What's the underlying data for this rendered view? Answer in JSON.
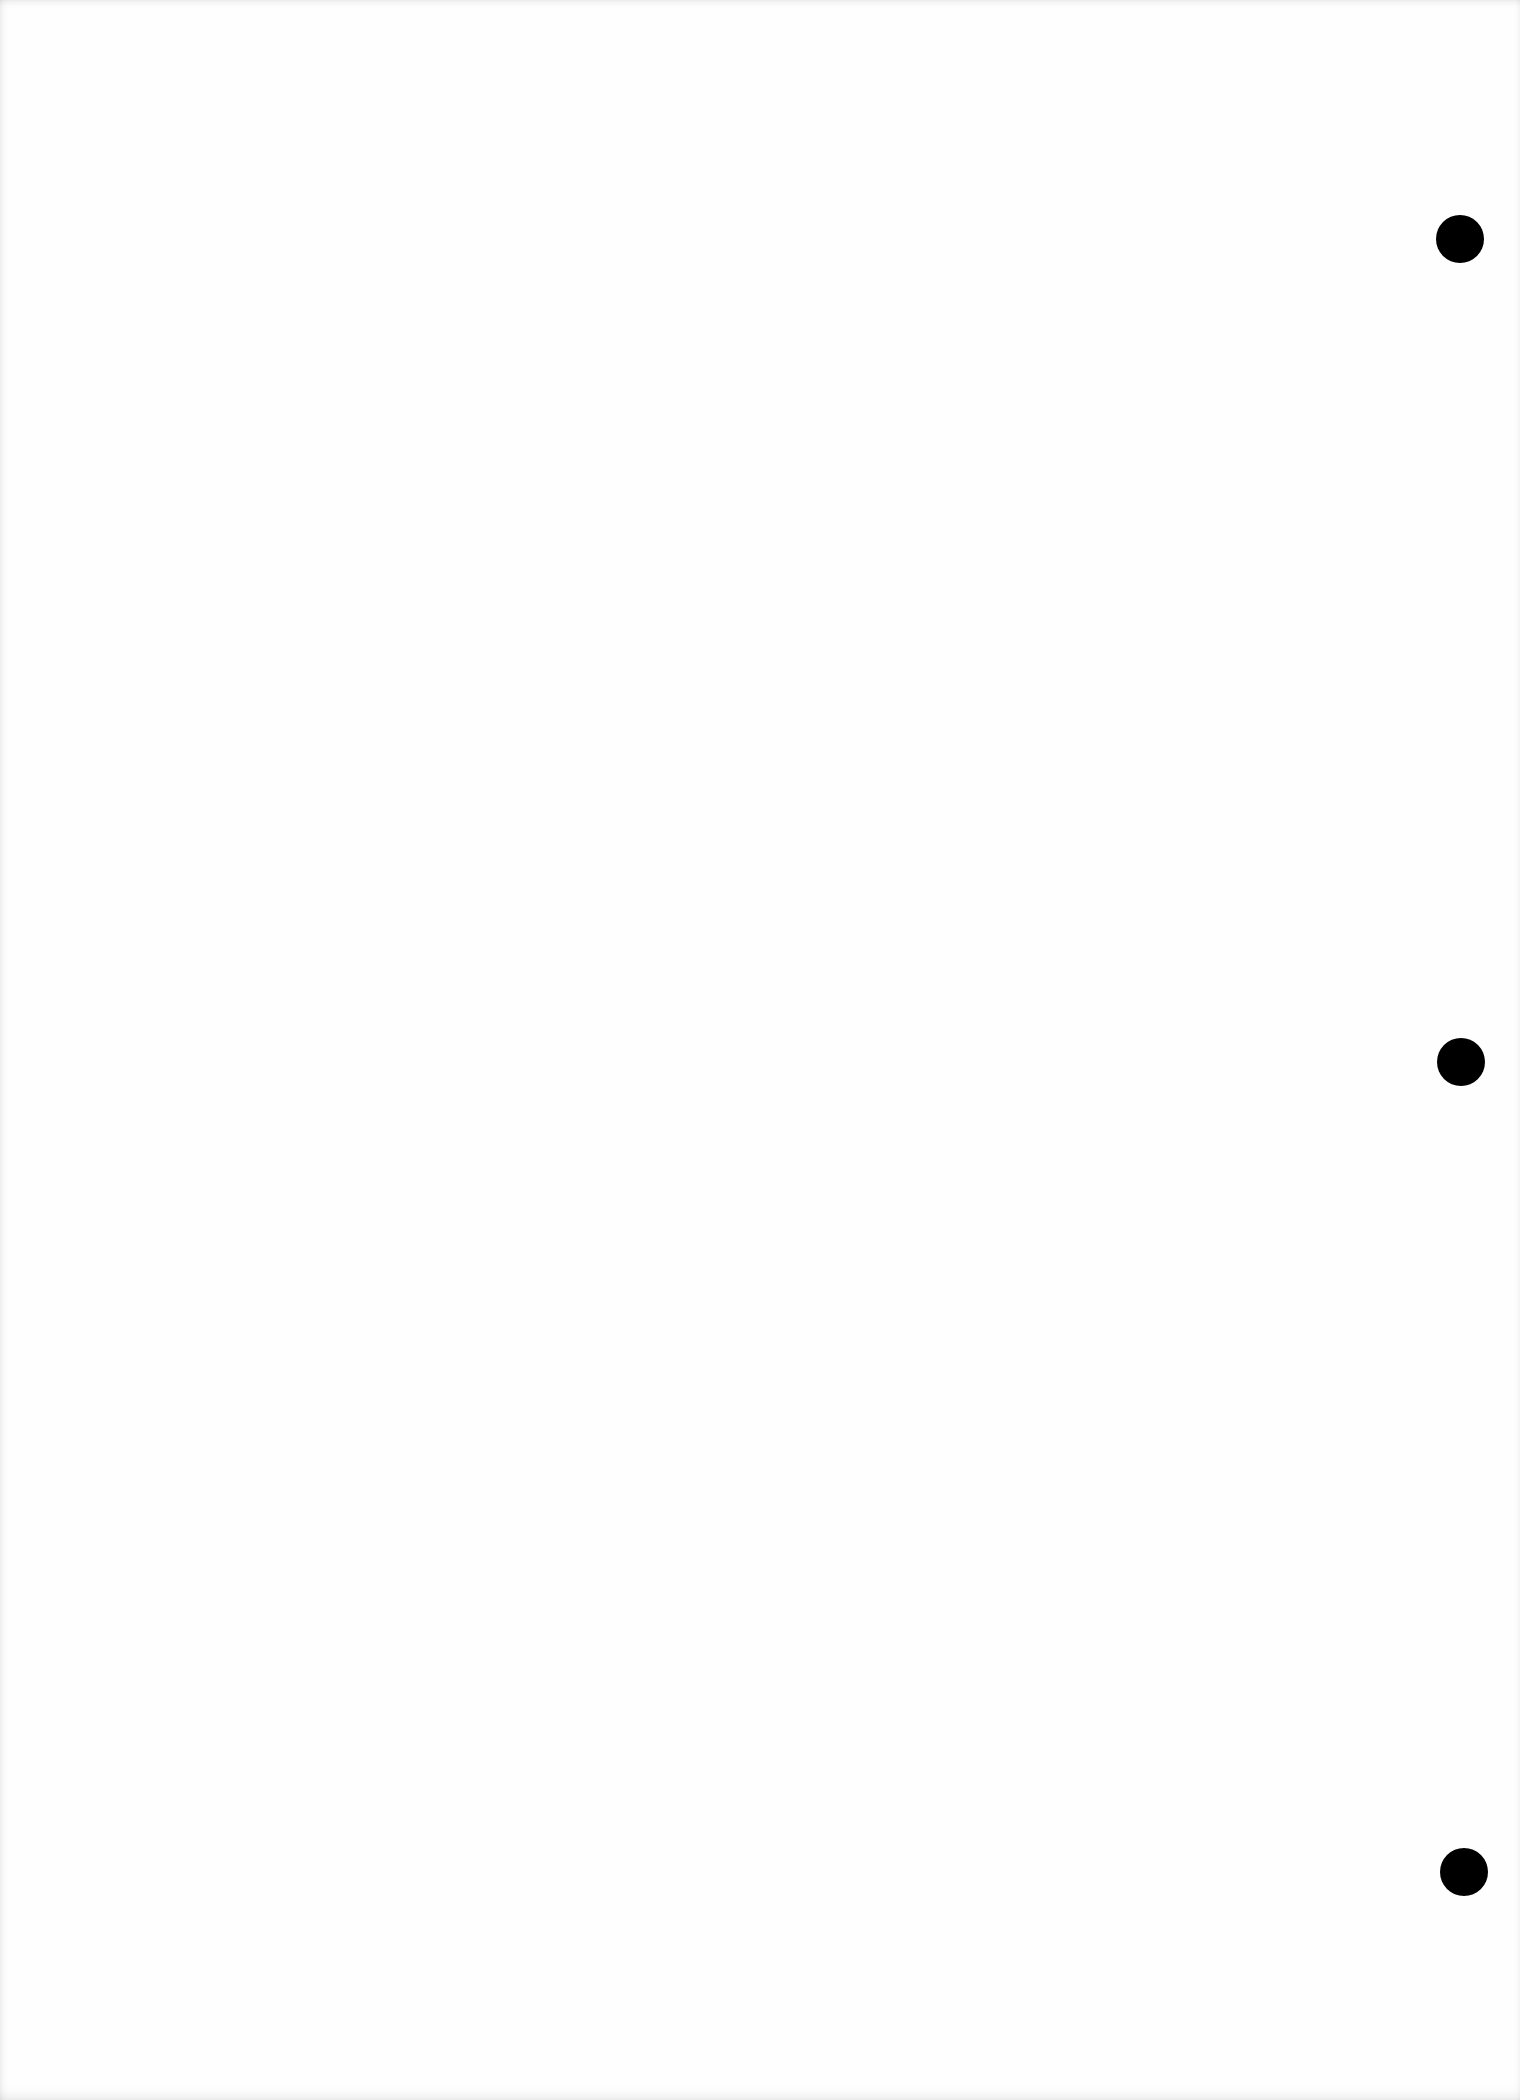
{
  "document": {
    "type": "blank-page",
    "background_color": "#fefefe",
    "punch_holes": [
      {
        "cx": 1460,
        "cy": 239,
        "diameter": 48,
        "color": "#000000"
      },
      {
        "cx": 1461,
        "cy": 1062,
        "diameter": 48,
        "color": "#000000"
      },
      {
        "cx": 1464,
        "cy": 1872,
        "diameter": 48,
        "color": "#000000"
      }
    ]
  }
}
